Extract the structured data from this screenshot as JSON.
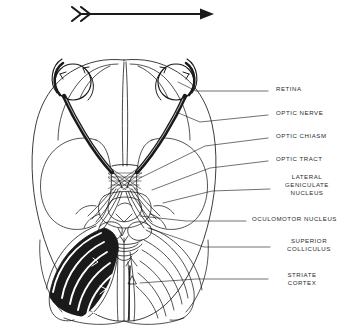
{
  "figure": {
    "background_color": "#ffffff",
    "ink_color": "#1a1a1a",
    "label_color": "#2b2b2b",
    "direction_arrow": {
      "name": "direction-arrow",
      "description": "horizontal arrow pointing right with feathered double-chevron tail",
      "x1": 72,
      "y1": 14,
      "x2": 208,
      "y2": 14
    }
  },
  "labels": [
    {
      "id": "retina",
      "text": "RETINA",
      "lines": [
        "RETINA"
      ],
      "x": 276,
      "y": 88,
      "leader": [
        [
          268,
          91
        ],
        [
          196,
          91
        ],
        [
          178,
          82
        ]
      ]
    },
    {
      "id": "optic-nerve",
      "text": "OPTIC NERVE",
      "lines": [
        "OPTIC NERVE"
      ],
      "x": 276,
      "y": 112,
      "leader": [
        [
          268,
          115
        ],
        [
          200,
          122
        ],
        [
          176,
          112
        ]
      ]
    },
    {
      "id": "optic-chiasm",
      "text": "OPTIC CHIASM",
      "lines": [
        "OPTIC CHIASM"
      ],
      "x": 276,
      "y": 135,
      "leader": [
        [
          268,
          138
        ],
        [
          205,
          146
        ],
        [
          142,
          177
        ]
      ]
    },
    {
      "id": "optic-tract",
      "text": "OPTIC TRACT",
      "lines": [
        "OPTIC TRACT"
      ],
      "x": 276,
      "y": 158,
      "leader": [
        [
          268,
          161
        ],
        [
          210,
          168
        ],
        [
          152,
          190
        ]
      ]
    },
    {
      "id": "lateral-geniculate-nucleus",
      "text": "LATERAL GENICULATE NUCLEUS",
      "lines": [
        "LATERAL",
        "GENICULATE",
        "NUCLEUS"
      ],
      "x": 276,
      "y": 176,
      "leader": [
        [
          270,
          189
        ],
        [
          212,
          191
        ],
        [
          163,
          203
        ]
      ]
    },
    {
      "id": "oculomotor-nucleus",
      "text": "OCULOMOTOR NUCLEUS",
      "lines": [
        "OCULOMOTOR NUCLEUS"
      ],
      "x": 252,
      "y": 218,
      "leader": [
        [
          246,
          221
        ],
        [
          186,
          221
        ],
        [
          140,
          216
        ]
      ]
    },
    {
      "id": "superior-colliculus",
      "text": "SUPERIOR COLLICULUS",
      "lines": [
        "SUPERIOR",
        "COLLICULUS"
      ],
      "x": 276,
      "y": 240,
      "leader": [
        [
          270,
          247
        ],
        [
          204,
          247
        ],
        [
          148,
          228
        ]
      ]
    },
    {
      "id": "striate-cortex",
      "text": "STRIATE CORTEX",
      "lines": [
        "STRIATE",
        "CORTEX"
      ],
      "x": 276,
      "y": 274,
      "leader": [
        [
          268,
          279
        ],
        [
          196,
          279
        ],
        [
          140,
          283
        ]
      ]
    }
  ],
  "anatomy": {
    "eyes": [
      {
        "side": "left",
        "cx": 73,
        "cy": 82,
        "r": 18
      },
      {
        "side": "right",
        "cx": 176,
        "cy": 82,
        "r": 18
      }
    ],
    "chiasm": {
      "cx": 124,
      "cy": 178
    },
    "structures": [
      "retina",
      "optic nerve",
      "optic chiasm",
      "optic tract",
      "lateral geniculate nucleus",
      "oculomotor nucleus",
      "superior colliculus",
      "striate cortex"
    ],
    "shading_note": "left-hemisphere optic radiation drawn as solid black bands; right-hemisphere drawn as open outlines"
  }
}
